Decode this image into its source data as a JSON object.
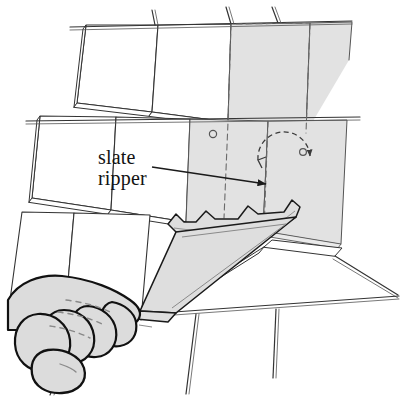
{
  "figure": {
    "background_color": "#ffffff",
    "line_color": "#1a1a1a",
    "slate_fill_color": "#ffffff",
    "highlight_fill_color": "#e2e2e2",
    "tool_fill_color": "#dedede",
    "hand_fill_color": "#dcdcdc"
  },
  "callout": {
    "label_line_1": "slate",
    "label_line_2": "ripper",
    "leader_from_x": 152,
    "leader_from_y": 167,
    "leader_to_x": 266,
    "leader_to_y": 184,
    "text_x": 98,
    "text_y": 164,
    "font_size": 20
  },
  "annotations": {
    "rotation_arc": {
      "name": "nail-removal-arc",
      "style": "dashed-semicircle-with-arrowheads",
      "center_x": 284,
      "center_y": 158,
      "radius": 26
    },
    "nail_heads": [
      {
        "name": "nail-head-left",
        "cx": 213,
        "cy": 134,
        "r": 3.5
      },
      {
        "name": "nail-head-right",
        "cx": 303,
        "cy": 152,
        "r": 3.5
      }
    ]
  },
  "roof": {
    "description": "courses of slate tiles laid in overlapping rows shown in oblique projection",
    "tile_thickness_px": 4,
    "courses": 3,
    "highlighted_slate": {
      "name": "slate-being-removed",
      "state": "shaded and outlined with dashed hidden edges"
    }
  },
  "tool": {
    "name": "slate-ripper",
    "parts": {
      "blade_head": "notched hooked cutting barbs",
      "shaft": "long tapered flat bar",
      "handle": "offset grip end held in fist"
    }
  },
  "hand": {
    "name": "gripping-fist",
    "fingers": 4,
    "thumb": 1,
    "description": "closed fist pulling the slate ripper handle downward"
  }
}
